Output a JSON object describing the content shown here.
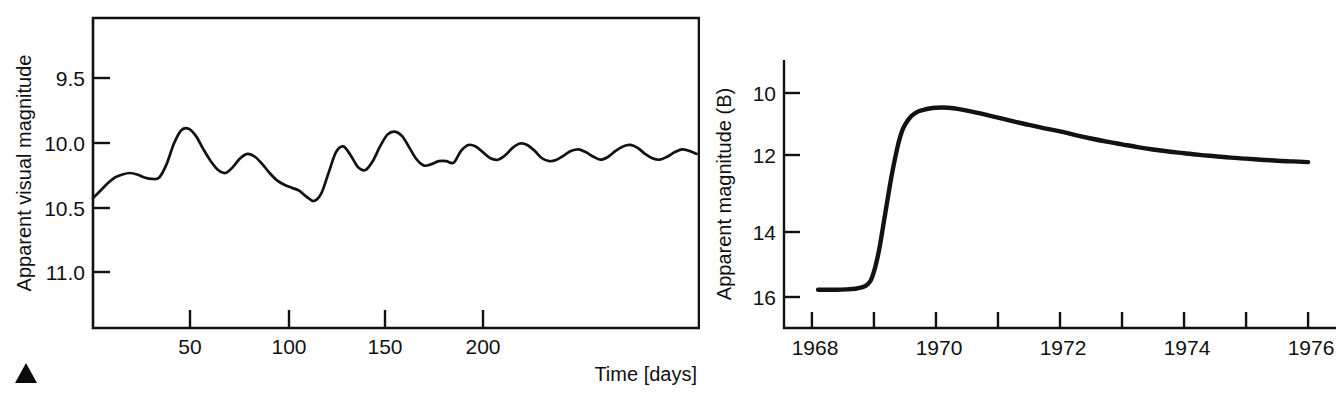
{
  "figure": {
    "marker": {
      "name": "triangle-marker",
      "glyph": "▲"
    }
  },
  "chart_data": [
    {
      "id": "left",
      "type": "line",
      "title": "",
      "xlabel": "Time [days]",
      "ylabel": "Apparent visual magnitude",
      "xlim": [
        0,
        247
      ],
      "ylim": [
        11.35,
        9.25
      ],
      "y_inverted": true,
      "grid": false,
      "legend": "none",
      "xticks": [
        50,
        100,
        150,
        200
      ],
      "xtick_labels": [
        "50",
        "100",
        "150",
        "200"
      ],
      "yticks": [
        9.5,
        10.0,
        10.5,
        11.0
      ],
      "ytick_labels": [
        "9.5",
        "10.0",
        "10.5",
        "11.0"
      ],
      "series": [
        {
          "name": "visual light curve",
          "x": [
            0,
            3,
            6,
            9,
            12,
            15,
            18,
            21,
            24,
            27,
            30,
            33,
            36,
            39,
            42,
            45,
            48,
            51,
            54,
            57,
            60,
            63,
            66,
            69,
            72,
            75,
            78,
            81,
            84,
            87,
            90,
            93,
            96,
            99,
            102,
            105,
            108,
            111,
            114,
            117,
            120,
            123,
            126,
            129,
            132,
            135,
            138,
            141,
            144,
            147,
            150,
            153,
            156,
            159,
            162,
            165,
            168,
            171,
            174,
            177,
            180,
            183,
            186,
            189,
            192,
            195,
            198,
            201,
            204,
            207,
            210,
            213,
            216,
            219,
            222,
            225,
            228,
            231,
            234,
            237,
            240,
            243,
            246
          ],
          "y": [
            10.47,
            10.42,
            10.37,
            10.33,
            10.31,
            10.3,
            10.31,
            10.33,
            10.34,
            10.33,
            10.24,
            10.1,
            10.01,
            10.0,
            10.05,
            10.14,
            10.22,
            10.28,
            10.3,
            10.26,
            10.2,
            10.17,
            10.19,
            10.24,
            10.3,
            10.35,
            10.38,
            10.4,
            10.42,
            10.46,
            10.49,
            10.44,
            10.3,
            10.16,
            10.12,
            10.18,
            10.26,
            10.28,
            10.22,
            10.12,
            10.04,
            10.02,
            10.05,
            10.13,
            10.21,
            10.25,
            10.24,
            10.22,
            10.22,
            10.23,
            10.15,
            10.11,
            10.12,
            10.16,
            10.2,
            10.21,
            10.18,
            10.13,
            10.1,
            10.11,
            10.15,
            10.2,
            10.22,
            10.21,
            10.18,
            10.15,
            10.14,
            10.16,
            10.19,
            10.21,
            10.19,
            10.15,
            10.12,
            10.11,
            10.13,
            10.17,
            10.2,
            10.21,
            10.19,
            10.16,
            10.14,
            10.15,
            10.17
          ]
        }
      ]
    },
    {
      "id": "right",
      "type": "line",
      "title": "",
      "xlabel": "",
      "ylabel": "Apparent magnitude (B)",
      "xlim": [
        1967.55,
        1976.45
      ],
      "ylim": [
        16.85,
        9.0
      ],
      "y_inverted": true,
      "grid": false,
      "legend": "none",
      "xticks": [
        1968,
        1969,
        1970,
        1971,
        1972,
        1973,
        1974,
        1975,
        1976
      ],
      "xtick_labels": [
        "1968",
        "",
        "1970",
        "",
        "1972",
        "",
        "1974",
        "",
        "1976"
      ],
      "yticks": [
        10,
        12,
        14,
        16
      ],
      "ytick_labels": [
        "10",
        "12",
        "14",
        "16"
      ],
      "series": [
        {
          "name": "B-band light curve",
          "x": [
            1968.1,
            1968.25,
            1968.4,
            1968.55,
            1968.7,
            1968.8,
            1968.88,
            1968.95,
            1969.0,
            1969.05,
            1969.1,
            1969.15,
            1969.2,
            1969.25,
            1969.3,
            1969.35,
            1969.4,
            1969.45,
            1969.5,
            1969.6,
            1969.7,
            1969.8,
            1969.9,
            1970.0,
            1970.1,
            1970.2,
            1970.35,
            1970.5,
            1970.75,
            1971.0,
            1971.25,
            1971.5,
            1971.75,
            1972.0,
            1972.25,
            1972.5,
            1972.75,
            1973.0,
            1973.25,
            1973.5,
            1973.75,
            1974.0,
            1974.25,
            1974.5,
            1974.75,
            1975.0,
            1975.25,
            1975.5,
            1975.75,
            1976.0
          ],
          "y": [
            15.73,
            15.73,
            15.73,
            15.72,
            15.7,
            15.66,
            15.6,
            15.45,
            15.2,
            14.85,
            14.4,
            13.85,
            13.3,
            12.75,
            12.25,
            11.8,
            11.4,
            11.1,
            10.9,
            10.65,
            10.52,
            10.46,
            10.42,
            10.4,
            10.39,
            10.4,
            10.43,
            10.48,
            10.58,
            10.69,
            10.8,
            10.9,
            11.0,
            11.09,
            11.2,
            11.3,
            11.39,
            11.47,
            11.55,
            11.62,
            11.68,
            11.73,
            11.78,
            11.82,
            11.86,
            11.89,
            11.92,
            11.95,
            11.97,
            11.99
          ]
        }
      ]
    }
  ]
}
